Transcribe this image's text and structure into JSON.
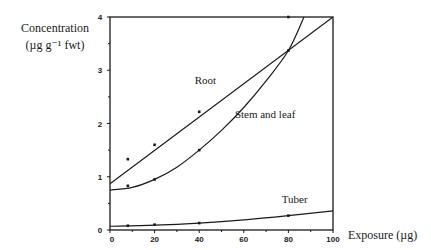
{
  "chart_data": {
    "type": "line",
    "title": "",
    "xlabel": "Exposure (µg)",
    "ylabel": "Concentration (µg g⁻¹ fwt)",
    "ylabel_line1": "Concentration",
    "ylabel_line2": "(µg g⁻¹ fwt)",
    "xlim": [
      0,
      100
    ],
    "ylim": [
      0,
      4
    ],
    "x_ticks": [
      0,
      20,
      40,
      60,
      80,
      100
    ],
    "y_ticks": [
      0,
      1,
      2,
      3,
      4
    ],
    "grid": false,
    "legend": "inline labels",
    "series": [
      {
        "name": "Root",
        "fit": "linear",
        "points": [
          {
            "x": 8,
            "y": 1.33
          },
          {
            "x": 20,
            "y": 1.6
          },
          {
            "x": 40,
            "y": 2.22
          },
          {
            "x": 80,
            "y": 4.0
          }
        ],
        "fit_curve": [
          {
            "x": 0,
            "y": 0.87
          },
          {
            "x": 100,
            "y": 4.0
          }
        ],
        "label_pos": {
          "x": 38,
          "y": 2.75
        }
      },
      {
        "name": "Stem and leaf",
        "fit": "quadratic",
        "points": [
          {
            "x": 8,
            "y": 0.83
          },
          {
            "x": 20,
            "y": 0.95
          },
          {
            "x": 40,
            "y": 1.5
          },
          {
            "x": 80,
            "y": 3.37
          }
        ],
        "fit_curve": [
          {
            "x": 0,
            "y": 0.75
          },
          {
            "x": 10,
            "y": 0.8
          },
          {
            "x": 20,
            "y": 0.95
          },
          {
            "x": 30,
            "y": 1.18
          },
          {
            "x": 40,
            "y": 1.5
          },
          {
            "x": 50,
            "y": 1.87
          },
          {
            "x": 60,
            "y": 2.3
          },
          {
            "x": 70,
            "y": 2.8
          },
          {
            "x": 80,
            "y": 3.37
          },
          {
            "x": 87,
            "y": 4.0
          }
        ],
        "label_pos": {
          "x": 56,
          "y": 2.1
        }
      },
      {
        "name": "Tuber",
        "fit": "quadratic",
        "points": [
          {
            "x": 8,
            "y": 0.08
          },
          {
            "x": 20,
            "y": 0.1
          },
          {
            "x": 40,
            "y": 0.13
          },
          {
            "x": 80,
            "y": 0.27
          }
        ],
        "fit_curve": [
          {
            "x": 0,
            "y": 0.07
          },
          {
            "x": 20,
            "y": 0.09
          },
          {
            "x": 40,
            "y": 0.13
          },
          {
            "x": 60,
            "y": 0.19
          },
          {
            "x": 80,
            "y": 0.27
          },
          {
            "x": 100,
            "y": 0.36
          }
        ],
        "label_pos": {
          "x": 77,
          "y": 0.5
        }
      }
    ]
  }
}
